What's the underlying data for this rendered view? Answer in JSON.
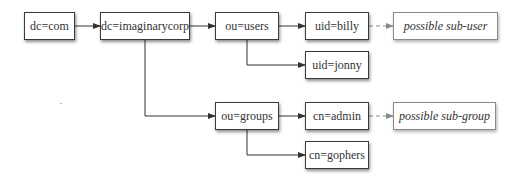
{
  "diagram": {
    "colors": {
      "line": "#333333",
      "dashed_line": "#8a8a8a",
      "box_border": "#3a3a3a",
      "text": "#333333"
    },
    "nodes": {
      "dc_com": {
        "label": "dc=com"
      },
      "dc_imaginarycorp": {
        "label": "dc=imaginarycorp"
      },
      "ou_users": {
        "label": "ou=users"
      },
      "uid_billy": {
        "label": "uid=billy"
      },
      "uid_jonny": {
        "label": "uid=jonny"
      },
      "possible_sub_user": {
        "label": "possible sub-user"
      },
      "ou_groups": {
        "label": "ou=groups"
      },
      "cn_admin": {
        "label": "cn=admin"
      },
      "cn_gophers": {
        "label": "cn=gophers"
      },
      "possible_sub_group": {
        "label": "possible sub-group"
      }
    },
    "edges": [
      {
        "from": "dc=com",
        "to": "dc=imaginarycorp",
        "style": "solid"
      },
      {
        "from": "dc=imaginarycorp",
        "to": "ou=users",
        "style": "solid"
      },
      {
        "from": "dc=imaginarycorp",
        "to": "ou=groups",
        "style": "solid"
      },
      {
        "from": "ou=users",
        "to": "uid=billy",
        "style": "solid"
      },
      {
        "from": "ou=users",
        "to": "uid=jonny",
        "style": "solid"
      },
      {
        "from": "uid=billy",
        "to": "possible sub-user",
        "style": "dashed"
      },
      {
        "from": "ou=groups",
        "to": "cn=admin",
        "style": "solid"
      },
      {
        "from": "ou=groups",
        "to": "cn=gophers",
        "style": "solid"
      },
      {
        "from": "cn=admin",
        "to": "possible sub-group",
        "style": "dashed"
      }
    ]
  }
}
